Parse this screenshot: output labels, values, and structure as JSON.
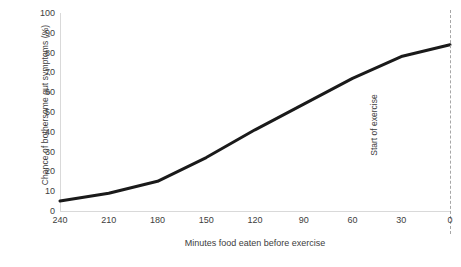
{
  "chart_data": {
    "type": "line",
    "title": "",
    "xlabel": "Minutes food eaten before exercise",
    "ylabel": "Chance of bothersome gut symptoms (%)",
    "x": [
      240,
      210,
      180,
      150,
      120,
      90,
      60,
      30,
      0
    ],
    "values": [
      5,
      9,
      15,
      27,
      41,
      54,
      67,
      78,
      84
    ],
    "series": [
      {
        "name": "Chance of bothersome gut symptoms",
        "values": [
          5,
          9,
          15,
          27,
          41,
          54,
          67,
          78,
          84
        ],
        "color": "#1a1a1a"
      }
    ],
    "xtick_labels": [
      "240",
      "210",
      "180",
      "150",
      "120",
      "90",
      "60",
      "30",
      "0"
    ],
    "ytick_labels": [
      "100",
      "90",
      "80",
      "70",
      "60",
      "50",
      "40",
      "30",
      "20",
      "10",
      "0"
    ],
    "xlim": [
      240,
      0
    ],
    "ylim": [
      0,
      100
    ],
    "x_axis_reversed": true,
    "grid": false,
    "legend": false,
    "annotations": [
      {
        "text": "Start of exercise",
        "x": 0,
        "style": "vertical-dashed-line",
        "rotation": -90,
        "line_color": "#a6a6a6"
      }
    ],
    "colors": {
      "line": "#1a1a1a",
      "axis": "#d9d9d9",
      "text": "#3d3d3d",
      "background": "#ffffff",
      "marker_line": "#a6a6a6"
    }
  }
}
